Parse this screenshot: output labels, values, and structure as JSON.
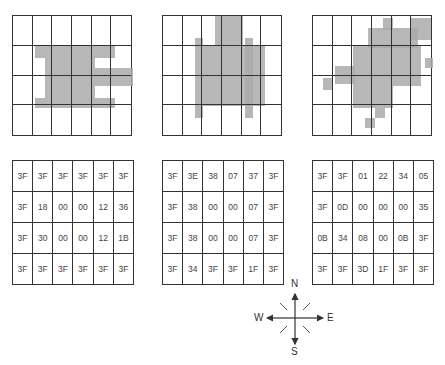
{
  "figure": {
    "grids": [
      {
        "id": "object-1",
        "rows": 4,
        "cols": 6
      },
      {
        "id": "object-2",
        "rows": 4,
        "cols": 6
      },
      {
        "id": "object-3",
        "rows": 4,
        "cols": 6
      }
    ],
    "code_tables": [
      {
        "id": "codes-1",
        "rows": [
          [
            "3F",
            "3F",
            "3F",
            "3F",
            "3F",
            "3F"
          ],
          [
            "3F",
            "18",
            "00",
            "00",
            "12",
            "36"
          ],
          [
            "3F",
            "30",
            "00",
            "00",
            "12",
            "1B"
          ],
          [
            "3F",
            "3F",
            "3F",
            "3F",
            "3F",
            "3F"
          ]
        ]
      },
      {
        "id": "codes-2",
        "rows": [
          [
            "3F",
            "3E",
            "38",
            "07",
            "37",
            "3F"
          ],
          [
            "3F",
            "38",
            "00",
            "00",
            "07",
            "3F"
          ],
          [
            "3F",
            "38",
            "00",
            "00",
            "07",
            "3F"
          ],
          [
            "3F",
            "34",
            "3F",
            "3F",
            "1F",
            "3F"
          ]
        ]
      },
      {
        "id": "codes-3",
        "rows": [
          [
            "3F",
            "3F",
            "01",
            "22",
            "34",
            "05"
          ],
          [
            "3F",
            "0D",
            "00",
            "00",
            "00",
            "35"
          ],
          [
            "0B",
            "34",
            "08",
            "00",
            "0B",
            "3F"
          ],
          [
            "3F",
            "3F",
            "3D",
            "1F",
            "3F",
            "3F"
          ]
        ]
      }
    ],
    "compass": {
      "n": "N",
      "s": "S",
      "e": "E",
      "w": "W"
    }
  }
}
